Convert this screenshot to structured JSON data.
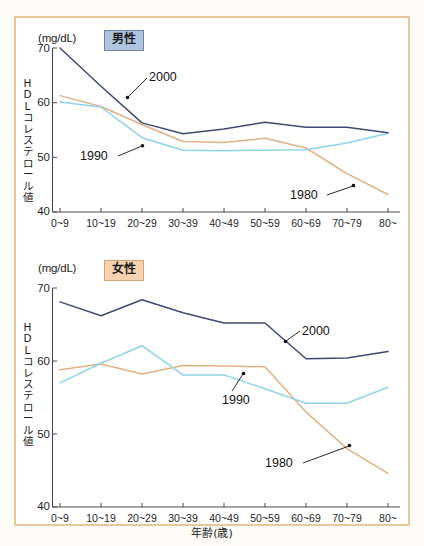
{
  "figure": {
    "unit_label": "(mg/dL)",
    "y_axis_title": "HDLコレステロール値",
    "x_axis_title": "年齢(歳)",
    "colors": {
      "series_1980": "#e0b183",
      "series_1990": "#8ed3e8",
      "series_2000": "#3f4a72",
      "frame": "#e8c79a",
      "badge_male_bg": "#aec4e0",
      "badge_female_bg": "#f6d2b0",
      "axis": "#4a4a4a"
    }
  },
  "panels": [
    {
      "id": "male",
      "badge": "男性",
      "unit_label": "(mg/dL)",
      "y_axis_title": "HDLコレステロール値"
    },
    {
      "id": "female",
      "badge": "女性",
      "unit_label": "(mg/dL)",
      "y_axis_title": "HDLコレステロール値",
      "x_axis_title": "年齢(歳)"
    }
  ],
  "series_labels": {
    "y1980": "1980",
    "y1990": "1990",
    "y2000": "2000"
  },
  "chart_data": [
    {
      "type": "line",
      "title": "男性",
      "xlabel": "年齢(歳)",
      "ylabel": "HDLコレステロール値",
      "unit": "(mg/dL)",
      "ylim": [
        40,
        70
      ],
      "yticks": [
        40,
        50,
        60,
        70
      ],
      "grid": false,
      "legend": "inline-annotations",
      "categories": [
        "0~9",
        "10~19",
        "20~29",
        "30~39",
        "40~49",
        "50~59",
        "60~69",
        "70~79",
        "80~"
      ],
      "series": [
        {
          "name": "1980",
          "color": "#e0b183",
          "values": [
            61.3,
            59.3,
            56.0,
            52.9,
            52.7,
            53.5,
            51.7,
            47.0,
            43.2
          ]
        },
        {
          "name": "1990",
          "color": "#8ed3e8",
          "values": [
            60.1,
            59.2,
            53.6,
            51.3,
            51.2,
            51.3,
            51.4,
            52.6,
            54.4
          ]
        },
        {
          "name": "2000",
          "color": "#3f4a72",
          "values": [
            70.0,
            63.0,
            56.3,
            54.3,
            55.2,
            56.4,
            55.5,
            55.5,
            54.5
          ]
        }
      ]
    },
    {
      "type": "line",
      "title": "女性",
      "xlabel": "年齢(歳)",
      "ylabel": "HDLコレステロール値",
      "unit": "(mg/dL)",
      "ylim": [
        40,
        70
      ],
      "yticks": [
        40,
        50,
        60,
        70
      ],
      "grid": false,
      "legend": "inline-annotations",
      "categories": [
        "0~9",
        "10~19",
        "20~29",
        "30~39",
        "40~49",
        "50~59",
        "60~69",
        "70~79",
        "80~"
      ],
      "series": [
        {
          "name": "1980",
          "color": "#e0b183",
          "values": [
            58.8,
            59.6,
            58.2,
            59.4,
            59.3,
            59.2,
            53.0,
            48.0,
            44.6
          ]
        },
        {
          "name": "1990",
          "color": "#8ed3e8",
          "values": [
            57.0,
            59.7,
            62.1,
            58.1,
            58.1,
            56.2,
            54.2,
            54.2,
            56.4
          ]
        },
        {
          "name": "2000",
          "color": "#3f4a72",
          "values": [
            68.1,
            66.2,
            68.4,
            66.6,
            65.2,
            65.2,
            60.3,
            60.4,
            61.3
          ]
        }
      ]
    }
  ]
}
